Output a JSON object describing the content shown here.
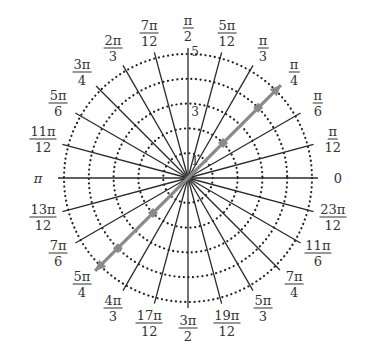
{
  "diagram": {
    "type": "polar-grid",
    "center": {
      "x": 188,
      "y": 178
    },
    "unit_px": 24.8,
    "rings": [
      1,
      2,
      3,
      4,
      5
    ],
    "ring_labels": [
      {
        "r": 1,
        "text": "1"
      },
      {
        "r": 3,
        "text": "3"
      },
      {
        "r": 5,
        "text": "5"
      }
    ],
    "angle_labels": [
      {
        "deg": 0,
        "num": "0",
        "den": ""
      },
      {
        "deg": 15,
        "num": "π",
        "den": "12"
      },
      {
        "deg": 30,
        "num": "π",
        "den": "6"
      },
      {
        "deg": 45,
        "num": "π",
        "den": "4"
      },
      {
        "deg": 60,
        "num": "π",
        "den": "3"
      },
      {
        "deg": 75,
        "num": "5π",
        "den": "12"
      },
      {
        "deg": 90,
        "num": "π",
        "den": "2"
      },
      {
        "deg": 105,
        "num": "7π",
        "den": "12"
      },
      {
        "deg": 120,
        "num": "2π",
        "den": "3"
      },
      {
        "deg": 135,
        "num": "3π",
        "den": "4"
      },
      {
        "deg": 150,
        "num": "5π",
        "den": "6"
      },
      {
        "deg": 165,
        "num": "11π",
        "den": "12"
      },
      {
        "deg": 180,
        "num": "π",
        "den": ""
      },
      {
        "deg": 195,
        "num": "13π",
        "den": "12"
      },
      {
        "deg": 210,
        "num": "7π",
        "den": "6"
      },
      {
        "deg": 225,
        "num": "5π",
        "den": "4"
      },
      {
        "deg": 240,
        "num": "4π",
        "den": "3"
      },
      {
        "deg": 255,
        "num": "17π",
        "den": "12"
      },
      {
        "deg": 270,
        "num": "3π",
        "den": "2"
      },
      {
        "deg": 285,
        "num": "19π",
        "den": "12"
      },
      {
        "deg": 300,
        "num": "5π",
        "den": "3"
      },
      {
        "deg": 315,
        "num": "7π",
        "den": "4"
      },
      {
        "deg": 330,
        "num": "11π",
        "den": "6"
      },
      {
        "deg": 345,
        "num": "23π",
        "den": "12"
      }
    ],
    "highlighted_line": {
      "angle": "π/4",
      "deg": 45,
      "color": "#8a8a8a",
      "arrow_extent_r": 5.3,
      "points": [
        {
          "r": 2,
          "theta": "π/4"
        },
        {
          "r": 4,
          "theta": "π/4"
        },
        {
          "r": -2,
          "theta": "π/4"
        },
        {
          "r": -4,
          "theta": "π/4"
        }
      ]
    },
    "colors": {
      "spokes": "#2a2a2a",
      "rings": "#222222",
      "text": "#333333"
    }
  }
}
